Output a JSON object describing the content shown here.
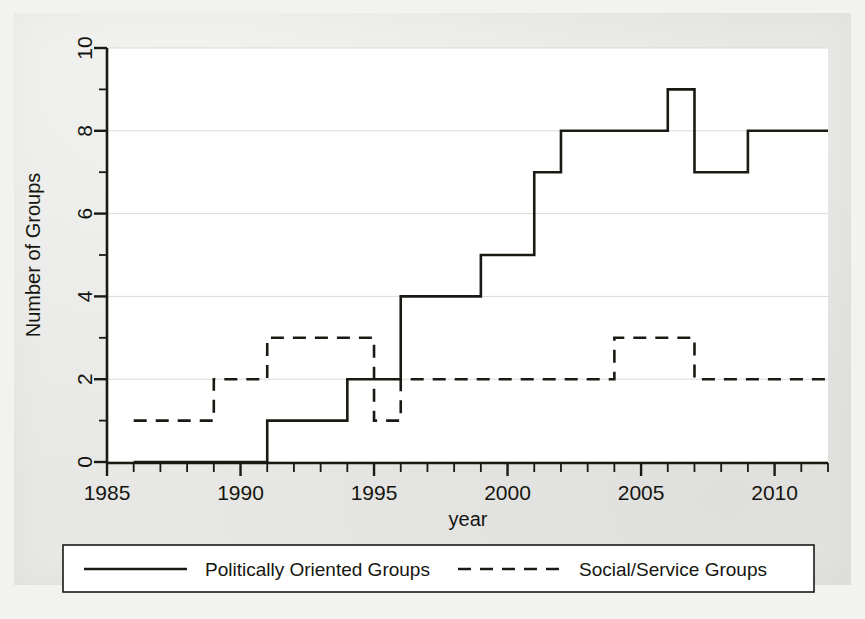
{
  "figure": {
    "background_color": "#e7e7e5",
    "plot_background_color": "#ffffff",
    "ink_color": "#1a1a14",
    "grid_color": "#d9d9d5"
  },
  "axes": {
    "x_title": "year",
    "y_title": "Number of Groups",
    "x_tick_labels": [
      "1985",
      "1990",
      "1995",
      "2000",
      "2005",
      "2010"
    ],
    "y_tick_labels": [
      "0",
      "2",
      "4",
      "6",
      "8",
      "10"
    ]
  },
  "legend": {
    "entries": [
      {
        "label": "Politically Oriented Groups",
        "style": "solid"
      },
      {
        "label": "Social/Service Groups",
        "style": "dashed"
      }
    ]
  },
  "chart_data": {
    "type": "line",
    "subtype": "step",
    "title": "",
    "xlabel": "year",
    "ylabel": "Number of Groups",
    "xlim": [
      1985,
      2012
    ],
    "ylim": [
      0,
      10
    ],
    "x_ticks_major": [
      1985,
      1990,
      1995,
      2000,
      2005,
      2010
    ],
    "x_ticks_minor_interval": 1,
    "y_ticks": [
      0,
      2,
      4,
      6,
      8,
      10
    ],
    "grid": "horizontal",
    "legend_position": "below-plot",
    "x": [
      1986,
      1987,
      1988,
      1989,
      1990,
      1991,
      1992,
      1993,
      1994,
      1995,
      1996,
      1997,
      1998,
      1999,
      2000,
      2001,
      2002,
      2003,
      2004,
      2005,
      2006,
      2007,
      2008,
      2009,
      2010,
      2011,
      2012
    ],
    "series": [
      {
        "name": "Politically Oriented Groups",
        "style": "solid",
        "color": "#1a1a14",
        "values": [
          0,
          0,
          0,
          0,
          0,
          1,
          1,
          1,
          2,
          2,
          4,
          4,
          4,
          5,
          5,
          7,
          8,
          8,
          8,
          8,
          9,
          7,
          7,
          8,
          8,
          8,
          8
        ]
      },
      {
        "name": "Social/Service Groups",
        "style": "dashed",
        "color": "#1a1a14",
        "values": [
          1,
          1,
          1,
          2,
          2,
          3,
          3,
          3,
          3,
          1,
          2,
          2,
          2,
          2,
          2,
          2,
          2,
          2,
          3,
          3,
          3,
          2,
          2,
          2,
          2,
          2,
          2
        ]
      }
    ]
  }
}
